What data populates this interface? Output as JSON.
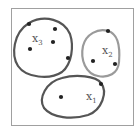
{
  "diagram": {
    "frame": {
      "x": 11,
      "y": 8,
      "width": 123,
      "height": 118,
      "stroke": "#9a9a9a"
    },
    "clusters": [
      {
        "id": "x3",
        "label": "x",
        "subscript": "3",
        "stroke": "#555555",
        "label_pos": [
          32,
          40
        ],
        "points": [
          [
            29,
            24
          ],
          [
            55,
            29
          ],
          [
            53,
            42
          ],
          [
            30,
            49
          ],
          [
            68,
            58
          ]
        ]
      },
      {
        "id": "x2",
        "label": "x",
        "subscript": "2",
        "stroke": "#999999",
        "label_pos": [
          102,
          54
        ],
        "points": [
          [
            108,
            31
          ],
          [
            93,
            61
          ],
          [
            115,
            64
          ]
        ]
      },
      {
        "id": "x1",
        "label": "x",
        "subscript": "1",
        "stroke": "#555555",
        "label_pos": [
          86,
          100
        ],
        "points": [
          [
            101,
            84
          ],
          [
            61,
            97
          ]
        ]
      }
    ],
    "point_color": "#222222"
  }
}
